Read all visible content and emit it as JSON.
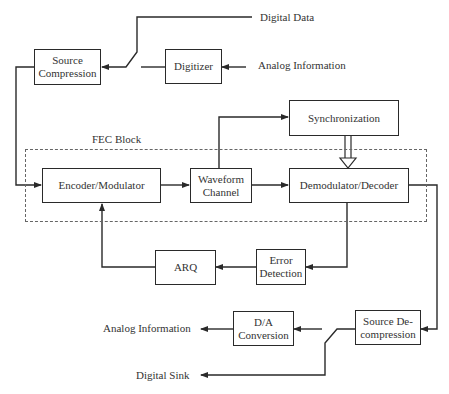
{
  "diagram": {
    "type": "block-diagram",
    "group": {
      "label": "FEC Block"
    },
    "blocks": {
      "source_compression": "Source Compression",
      "digitizer": "Digitizer",
      "synchronization": "Synchronization",
      "encoder_modulator": "Encoder/Modulator",
      "waveform_channel": "Waveform Channel",
      "demodulator_decoder": "Demodulator/Decoder",
      "error_detection": "Error Detection",
      "arq": "ARQ",
      "source_decompression": "Source De-compression",
      "da_conversion": "D/A Conversion"
    },
    "block_lines": {
      "source_compression": [
        "Source",
        "Compression"
      ],
      "waveform_channel": [
        "Waveform",
        "Channel"
      ],
      "error_detection": [
        "Error",
        "Detection"
      ],
      "source_decompression": [
        "Source De-",
        "compression"
      ],
      "da_conversion": [
        "D/A",
        "Conversion"
      ]
    },
    "terminals": {
      "digital_data": "Digital Data",
      "analog_info_in": "Analog Information",
      "analog_info_out": "Analog Information",
      "digital_sink": "Digital Sink"
    },
    "edges": [
      {
        "from": "Analog Information",
        "to": "Digitizer"
      },
      {
        "from": "Digitizer",
        "to": "Source Compression",
        "via": "switch"
      },
      {
        "from": "Digital Data",
        "to": "Source Compression",
        "via": "switch"
      },
      {
        "from": "Source Compression",
        "to": "Encoder/Modulator"
      },
      {
        "from": "Encoder/Modulator",
        "to": "Waveform Channel"
      },
      {
        "from": "Waveform Channel",
        "to": "Synchronization"
      },
      {
        "from": "Waveform Channel",
        "to": "Demodulator/Decoder"
      },
      {
        "from": "Synchronization",
        "to": "Demodulator/Decoder",
        "style": "double-arrow"
      },
      {
        "from": "Demodulator/Decoder",
        "to": "Error Detection"
      },
      {
        "from": "Error Detection",
        "to": "ARQ"
      },
      {
        "from": "ARQ",
        "to": "Encoder/Modulator"
      },
      {
        "from": "Demodulator/Decoder",
        "to": "Source De-compression"
      },
      {
        "from": "Source De-compression",
        "to": "D/A Conversion",
        "via": "switch"
      },
      {
        "from": "Source De-compression",
        "to": "Digital Sink",
        "via": "switch"
      },
      {
        "from": "D/A Conversion",
        "to": "Analog Information"
      }
    ]
  }
}
